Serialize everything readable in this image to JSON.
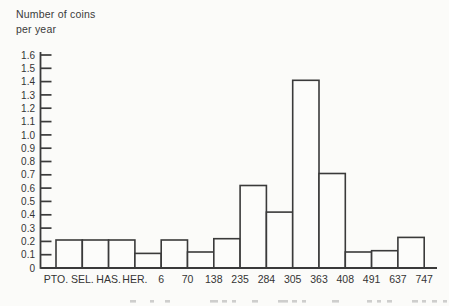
{
  "title": {
    "line1": "Number of coins",
    "line2": "per year"
  },
  "chart_data": {
    "type": "bar",
    "title": "Number of coins per year",
    "ylabel": "Number of coins per year",
    "xlabel": "",
    "bin_edges": [
      "PTO.",
      "SEL.",
      "HAS.",
      "HER.",
      "6",
      "70",
      "138",
      "235",
      "284",
      "305",
      "363",
      "408",
      "491",
      "637",
      "747"
    ],
    "values": [
      0.21,
      0.21,
      0.21,
      0.11,
      0.21,
      0.12,
      0.22,
      0.62,
      0.42,
      1.41,
      0.71,
      0.12,
      0.13,
      0.23
    ],
    "ylim": [
      0,
      1.6
    ],
    "ytick_step": 0.1,
    "ytick_labels": [
      "0",
      "0.1",
      "0.2",
      "0.3",
      "0.4",
      "0.5",
      "0.6",
      "0.7",
      "0.8",
      "0.9",
      "1.0",
      "1.1",
      "1.2",
      "1.3",
      "1.4",
      "1.5",
      "1.6"
    ],
    "grid": false,
    "bar_fill": "#fcfcfa",
    "line_color": "#3a3a3a",
    "text_color": "#343434"
  }
}
